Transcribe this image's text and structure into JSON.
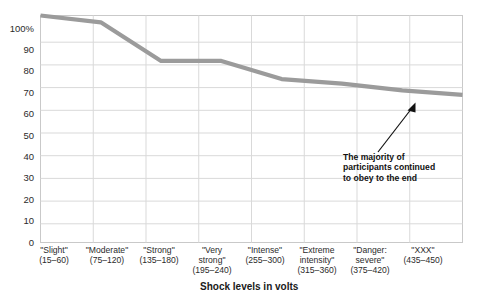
{
  "chart_data": {
    "type": "line",
    "title": "",
    "subtitle": "",
    "xlabel": "Shock levels in volts",
    "ylabel": "",
    "categories": [
      "\"Slight\"\n(15–60)",
      "\"Moderate\"\n(75–120)",
      "\"Strong\"\n(135–180)",
      "\"Very\nstrong\"\n(195–240)",
      "\"Intense\"\n(255–300)",
      "\"Extreme\nintensity\"\n(315–360)",
      "\"Danger:\nsevere\"\n(375–420)",
      "\"XXX\"\n(435–450)"
    ],
    "category_names": [
      "\"Slight\"",
      "\"Moderate\"",
      "\"Strong\"",
      "\"Very strong\"",
      "\"Intense\"",
      "\"Extreme intensity\"",
      "\"Danger: severe\"",
      "\"XXX\""
    ],
    "category_ranges": [
      "(15–60)",
      "(75–120)",
      "(135–180)",
      "(195–240)",
      "(255–300)",
      "(315–360)",
      "(375–420)",
      "(435–450)"
    ],
    "values": [
      100,
      97,
      80,
      80,
      72,
      70,
      67,
      65
    ],
    "ylim": [
      0,
      100
    ],
    "ytick_values": [
      0,
      10,
      20,
      30,
      40,
      50,
      60,
      70,
      80,
      90,
      100
    ],
    "ytick_labels": [
      "0",
      "10",
      "20",
      "30",
      "40",
      "50",
      "60",
      "70",
      "80",
      "90",
      "100%"
    ],
    "grid": true,
    "legend": "none",
    "series_color": "#9b9b9b",
    "grid_color": "#d6d6d6",
    "annotations": [
      {
        "text": "The majority of\nparticipants continued\nto obey to the end",
        "arrow": true
      }
    ]
  },
  "annotation": {
    "line1": "The majority of",
    "line2": "participants continued",
    "line3": "to obey to the end",
    "full": "The majority of\nparticipants continued\nto obey to the end"
  },
  "axis": {
    "x_title": "Shock levels in volts"
  }
}
